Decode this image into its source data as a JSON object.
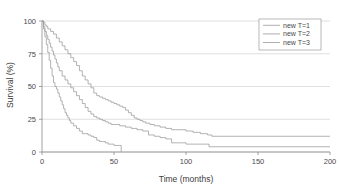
{
  "chart_data": {
    "type": "line",
    "title": "",
    "xlabel": "Time (months)",
    "ylabel": "Survival (%)",
    "xlim": [
      0,
      200
    ],
    "ylim": [
      0,
      100
    ],
    "xticks": [
      0,
      50,
      100,
      150,
      200
    ],
    "yticks": [
      0,
      25,
      50,
      75,
      100
    ],
    "xtick_labels": [
      "0",
      "50",
      "100",
      "150",
      "200"
    ],
    "ytick_labels": [
      "0",
      "25",
      "50",
      "75",
      "100"
    ],
    "grid": "horizontal",
    "legend_position": "top-right",
    "curve_color": "#9a9a9a",
    "grid_color": "#c9c9c9",
    "axis_color": "#8a8a8a",
    "series": [
      {
        "name": "new T=1",
        "color": "#9a9a9a",
        "points": [
          [
            0,
            100
          ],
          [
            1,
            99
          ],
          [
            2,
            97
          ],
          [
            3,
            96
          ],
          [
            4,
            94
          ],
          [
            6,
            92
          ],
          [
            8,
            90
          ],
          [
            10,
            87
          ],
          [
            12,
            84
          ],
          [
            14,
            81
          ],
          [
            16,
            78
          ],
          [
            18,
            75
          ],
          [
            20,
            72
          ],
          [
            22,
            69
          ],
          [
            24,
            66
          ],
          [
            26,
            62
          ],
          [
            28,
            58
          ],
          [
            30,
            55
          ],
          [
            32,
            52
          ],
          [
            34,
            49
          ],
          [
            36,
            45
          ],
          [
            38,
            43
          ],
          [
            40,
            42
          ],
          [
            42,
            41
          ],
          [
            44,
            40
          ],
          [
            46,
            39
          ],
          [
            48,
            38
          ],
          [
            50,
            37
          ],
          [
            52,
            36
          ],
          [
            54,
            35
          ],
          [
            56,
            34
          ],
          [
            58,
            32
          ],
          [
            60,
            30
          ],
          [
            62,
            28
          ],
          [
            64,
            26
          ],
          [
            66,
            25
          ],
          [
            68,
            24
          ],
          [
            70,
            23
          ],
          [
            72,
            22
          ],
          [
            75,
            21
          ],
          [
            78,
            20
          ],
          [
            82,
            19
          ],
          [
            86,
            18
          ],
          [
            90,
            17
          ],
          [
            95,
            17
          ],
          [
            100,
            16
          ],
          [
            105,
            15
          ],
          [
            110,
            14
          ],
          [
            115,
            13
          ],
          [
            118,
            12
          ],
          [
            125,
            12
          ],
          [
            150,
            12
          ],
          [
            175,
            12
          ],
          [
            200,
            12
          ]
        ]
      },
      {
        "name": "new T=2",
        "color": "#9a9a9a",
        "points": [
          [
            0,
            100
          ],
          [
            1,
            96
          ],
          [
            2,
            92
          ],
          [
            3,
            89
          ],
          [
            4,
            86
          ],
          [
            5,
            83
          ],
          [
            6,
            80
          ],
          [
            7,
            77
          ],
          [
            8,
            74
          ],
          [
            9,
            71
          ],
          [
            10,
            68
          ],
          [
            11,
            65
          ],
          [
            12,
            62
          ],
          [
            14,
            58
          ],
          [
            16,
            55
          ],
          [
            18,
            52
          ],
          [
            20,
            49
          ],
          [
            22,
            46
          ],
          [
            24,
            43
          ],
          [
            26,
            40
          ],
          [
            28,
            37
          ],
          [
            30,
            34
          ],
          [
            32,
            31
          ],
          [
            34,
            29
          ],
          [
            36,
            27
          ],
          [
            38,
            26
          ],
          [
            40,
            25
          ],
          [
            42,
            24
          ],
          [
            44,
            23
          ],
          [
            46,
            22
          ],
          [
            48,
            21
          ],
          [
            50,
            21
          ],
          [
            54,
            20
          ],
          [
            58,
            19
          ],
          [
            62,
            18
          ],
          [
            66,
            17
          ],
          [
            70,
            16
          ],
          [
            74,
            13
          ],
          [
            78,
            12
          ],
          [
            82,
            11
          ],
          [
            86,
            10
          ],
          [
            90,
            7
          ],
          [
            95,
            7
          ],
          [
            100,
            6
          ],
          [
            110,
            6
          ],
          [
            114,
            6
          ],
          [
            116,
            4
          ],
          [
            130,
            4
          ],
          [
            160,
            4
          ],
          [
            200,
            4
          ]
        ]
      },
      {
        "name": "new T=3",
        "color": "#9a9a9a",
        "points": [
          [
            0,
            100
          ],
          [
            1,
            94
          ],
          [
            2,
            88
          ],
          [
            3,
            82
          ],
          [
            4,
            76
          ],
          [
            5,
            70
          ],
          [
            6,
            64
          ],
          [
            7,
            58
          ],
          [
            8,
            53
          ],
          [
            9,
            50
          ],
          [
            10,
            48
          ],
          [
            11,
            45
          ],
          [
            12,
            42
          ],
          [
            13,
            39
          ],
          [
            14,
            36
          ],
          [
            15,
            33
          ],
          [
            16,
            30
          ],
          [
            17,
            28
          ],
          [
            18,
            26
          ],
          [
            19,
            24
          ],
          [
            20,
            22
          ],
          [
            22,
            20
          ],
          [
            24,
            18
          ],
          [
            26,
            16
          ],
          [
            28,
            14
          ],
          [
            30,
            14
          ],
          [
            32,
            13
          ],
          [
            34,
            12
          ],
          [
            36,
            11
          ],
          [
            38,
            9
          ],
          [
            40,
            8
          ],
          [
            42,
            8
          ],
          [
            44,
            7
          ],
          [
            46,
            6
          ],
          [
            48,
            6
          ],
          [
            50,
            5
          ],
          [
            52,
            5
          ],
          [
            54,
            5
          ],
          [
            55,
            0
          ]
        ]
      }
    ],
    "legend_entries": [
      {
        "label": "new T=1",
        "color": "#9a9a9a"
      },
      {
        "label": "new T=2",
        "color": "#9a9a9a"
      },
      {
        "label": "new T=3",
        "color": "#9a9a9a"
      }
    ]
  }
}
